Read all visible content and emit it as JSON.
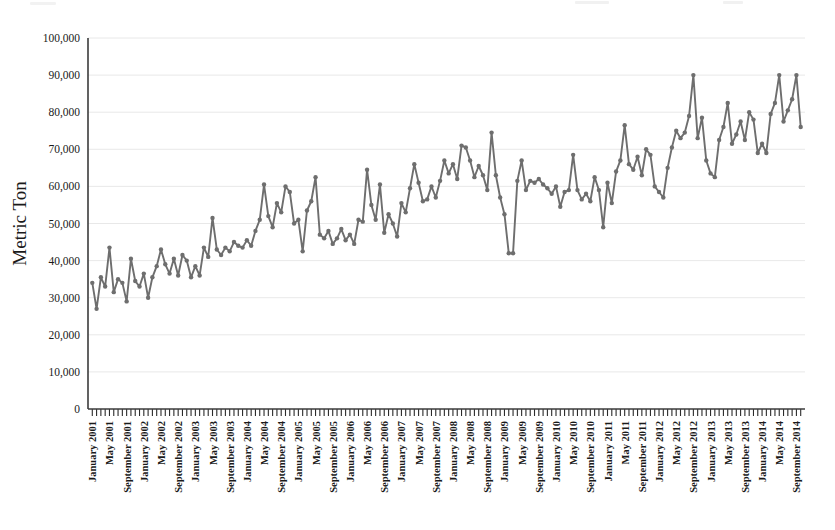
{
  "chart_data": {
    "type": "line",
    "title": "",
    "xlabel": "",
    "ylabel": "Metric Ton",
    "ylim": [
      0,
      100000
    ],
    "ytick_labels": [
      "0",
      "10,000",
      "20,000",
      "30,000",
      "40,000",
      "50,000",
      "60,000",
      "70,000",
      "80,000",
      "90,000",
      "100,000"
    ],
    "ytick_values": [
      0,
      10000,
      20000,
      30000,
      40000,
      50000,
      60000,
      70000,
      80000,
      90000,
      100000
    ],
    "grid": true,
    "legend": "none",
    "marker": "circle",
    "line_color": "#6e6e6e",
    "marker_color": "#6e6e6e",
    "axis_color": "#3b3b3b",
    "grid_color": "#e2e2e2",
    "start_period": "January 2001",
    "end_period": "October 2014",
    "x_tick_interval_months": 1,
    "x_label_interval_months": 4,
    "x_label_months": [
      "January",
      "May",
      "September"
    ],
    "xtick_labels": [
      "January 2001",
      "May 2001",
      "September 2001",
      "January 2002",
      "May 2002",
      "September 2002",
      "January 2003",
      "May 2003",
      "September 2003",
      "January 2004",
      "May 2004",
      "September 2004",
      "January 2005",
      "May 2005",
      "September 2005",
      "January 2006",
      "May 2006",
      "September 2006",
      "January 2007",
      "May 2007",
      "September 2007",
      "January 2008",
      "May 2008",
      "September 2008",
      "January 2009",
      "May 2009",
      "September 2009",
      "January 2010",
      "May 2010",
      "September 2010",
      "January 2011",
      "May 2011",
      "September 2011",
      "January 2012",
      "May 2012",
      "September 2012",
      "January 2013",
      "May 2013",
      "September 2013",
      "January 2014",
      "May 2014",
      "September 2014"
    ],
    "x": [
      "January 2001",
      "February 2001",
      "March 2001",
      "April 2001",
      "May 2001",
      "June 2001",
      "July 2001",
      "August 2001",
      "September 2001",
      "October 2001",
      "November 2001",
      "December 2001",
      "January 2002",
      "February 2002",
      "March 2002",
      "April 2002",
      "May 2002",
      "June 2002",
      "July 2002",
      "August 2002",
      "September 2002",
      "October 2002",
      "November 2002",
      "December 2002",
      "January 2003",
      "February 2003",
      "March 2003",
      "April 2003",
      "May 2003",
      "June 2003",
      "July 2003",
      "August 2003",
      "September 2003",
      "October 2003",
      "November 2003",
      "December 2003",
      "January 2004",
      "February 2004",
      "March 2004",
      "April 2004",
      "May 2004",
      "June 2004",
      "July 2004",
      "August 2004",
      "September 2004",
      "October 2004",
      "November 2004",
      "December 2004",
      "January 2005",
      "February 2005",
      "March 2005",
      "April 2005",
      "May 2005",
      "June 2005",
      "July 2005",
      "August 2005",
      "September 2005",
      "October 2005",
      "November 2005",
      "December 2005",
      "January 2006",
      "February 2006",
      "March 2006",
      "April 2006",
      "May 2006",
      "June 2006",
      "July 2006",
      "August 2006",
      "September 2006",
      "October 2006",
      "November 2006",
      "December 2006",
      "January 2007",
      "February 2007",
      "March 2007",
      "April 2007",
      "May 2007",
      "June 2007",
      "July 2007",
      "August 2007",
      "September 2007",
      "October 2007",
      "November 2007",
      "December 2007",
      "January 2008",
      "February 2008",
      "March 2008",
      "April 2008",
      "May 2008",
      "June 2008",
      "July 2008",
      "August 2008",
      "September 2008",
      "October 2008",
      "November 2008",
      "December 2008",
      "January 2009",
      "February 2009",
      "March 2009",
      "April 2009",
      "May 2009",
      "June 2009",
      "July 2009",
      "August 2009",
      "September 2009",
      "October 2009",
      "November 2009",
      "December 2009",
      "January 2010",
      "February 2010",
      "March 2010",
      "April 2010",
      "May 2010",
      "June 2010",
      "July 2010",
      "August 2010",
      "September 2010",
      "October 2010",
      "November 2010",
      "December 2010",
      "January 2011",
      "February 2011",
      "March 2011",
      "April 2011",
      "May 2011",
      "June 2011",
      "July 2011",
      "August 2011",
      "September 2011",
      "October 2011",
      "November 2011",
      "December 2011",
      "January 2012",
      "February 2012",
      "March 2012",
      "April 2012",
      "May 2012",
      "June 2012",
      "July 2012",
      "August 2012",
      "September 2012",
      "October 2012",
      "November 2012",
      "December 2012",
      "January 2013",
      "February 2013",
      "March 2013",
      "April 2013",
      "May 2013",
      "June 2013",
      "July 2013",
      "August 2013",
      "September 2013",
      "October 2013",
      "November 2013",
      "December 2013",
      "January 2014",
      "February 2014",
      "March 2014",
      "April 2014",
      "May 2014",
      "June 2014",
      "July 2014",
      "August 2014",
      "September 2014",
      "October 2014"
    ],
    "values": [
      34000,
      27000,
      35500,
      33000,
      43500,
      31500,
      35000,
      34000,
      29000,
      40500,
      34500,
      33000,
      36500,
      30000,
      35500,
      38500,
      43000,
      39000,
      36500,
      40500,
      36000,
      41500,
      40000,
      35500,
      38500,
      36000,
      43500,
      41000,
      51500,
      43000,
      41500,
      43500,
      42500,
      45000,
      44000,
      43500,
      45500,
      44000,
      48000,
      51000,
      60500,
      52000,
      49000,
      55500,
      53000,
      60000,
      58500,
      50000,
      51000,
      42500,
      53500,
      56000,
      62500,
      47000,
      46000,
      48000,
      44500,
      46000,
      48500,
      45500,
      47000,
      44500,
      51000,
      50500,
      64500,
      55000,
      51000,
      60500,
      47500,
      52500,
      50000,
      46500,
      55500,
      53000,
      59500,
      66000,
      61000,
      56000,
      56500,
      60000,
      57000,
      61500,
      67000,
      63500,
      66000,
      62000,
      71000,
      70500,
      67000,
      62500,
      65500,
      63000,
      59000,
      74500,
      63000,
      57000,
      52500,
      42000,
      42000,
      61500,
      67000,
      59000,
      61500,
      61000,
      62000,
      60500,
      59500,
      58000,
      60000,
      54500,
      58500,
      59000,
      68500,
      59000,
      56500,
      58000,
      56000,
      62500,
      59000,
      49000,
      61000,
      55500,
      64000,
      67000,
      76500,
      66000,
      64500,
      68000,
      63000,
      70000,
      68500,
      60000,
      58500,
      57000,
      65000,
      70500,
      75000,
      73000,
      74500,
      79000,
      90000,
      73000,
      78500,
      67000,
      63500,
      62500,
      72500,
      76000,
      82500,
      71500,
      74000,
      77500,
      72500,
      80000,
      78000,
      69000,
      71500,
      69000,
      79500,
      82500,
      90000,
      77500,
      80500,
      83500,
      90000,
      76000
    ]
  }
}
